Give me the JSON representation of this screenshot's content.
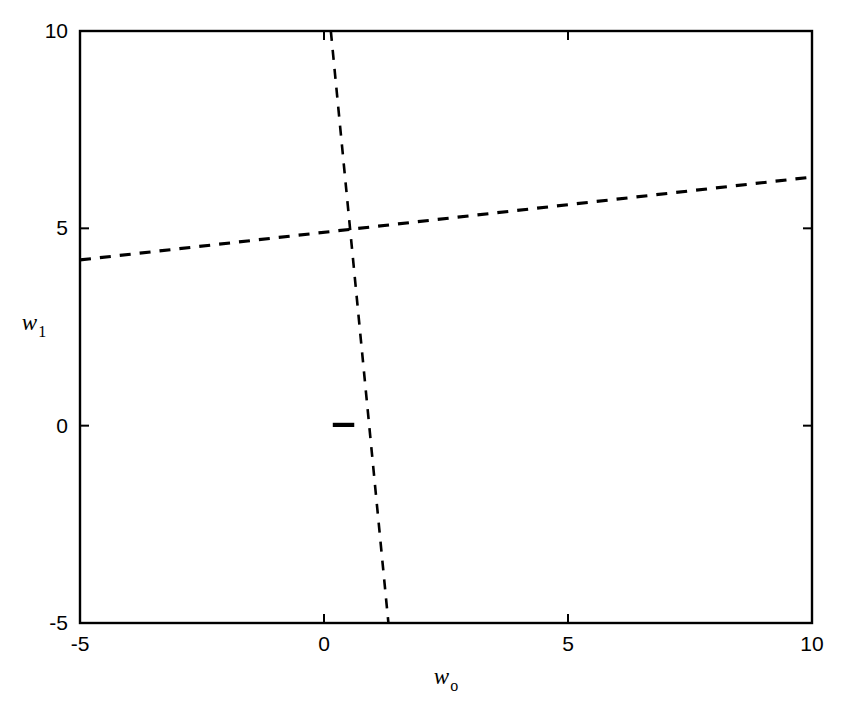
{
  "figure": {
    "title": "",
    "background_color": "#ffffff",
    "line_color": "#000000",
    "width": 847,
    "height": 712
  },
  "axes": {
    "x_label_main": "w",
    "x_label_sub": "o",
    "y_label_main": "w",
    "y_label_sub": "1",
    "x_ticks": [
      "-5",
      "0",
      "5",
      "10"
    ],
    "y_ticks": [
      "-5",
      "0",
      "5",
      "10"
    ],
    "x_tick_values": [
      -5,
      0,
      5,
      10
    ],
    "y_tick_values": [
      -5,
      0,
      5,
      10
    ],
    "xlim": [
      -5,
      10
    ],
    "ylim": [
      -5,
      10
    ],
    "frame": {
      "left": 80,
      "top": 31,
      "right": 812,
      "bottom": 623
    },
    "tick_direction": "in",
    "tick_length": 9,
    "frame_line_width": 2.4
  },
  "chart_data": {
    "type": "contour",
    "title": "",
    "xlabel": "w_o",
    "ylabel": "w_1",
    "xlim": [
      -5,
      10
    ],
    "ylim": [
      -5,
      10
    ],
    "grid": false,
    "legend": null,
    "center": [
      0.55,
      4.55
    ],
    "quadratic_form": {
      "a": 1.0,
      "b": 0.132,
      "c": 0.0062,
      "note": "levels of a*(dx)^2 + 2*b*dx*dy + c*(dy)^2 relative to center"
    },
    "contour_levels": [
      0.055,
      0.3,
      1.05,
      3.6,
      13.0,
      33.0,
      62.0,
      105.0,
      170.0
    ],
    "contour_line_width": 2.1,
    "dashed_lines": [
      {
        "name": "major-axis",
        "p1": [
          -5,
          4.2
        ],
        "p2": [
          10,
          6.3
        ],
        "dash": "11,9",
        "width": 3.1
      },
      {
        "name": "minor-axis",
        "p1": [
          0.14,
          10
        ],
        "p2": [
          1.32,
          -5
        ],
        "dash": "10,9",
        "width": 2.6
      }
    ],
    "marker_segment": {
      "name": "contour-corner-artifact",
      "x1": 0.18,
      "x2": 0.62,
      "y": 0.02,
      "width": 4.2
    }
  }
}
